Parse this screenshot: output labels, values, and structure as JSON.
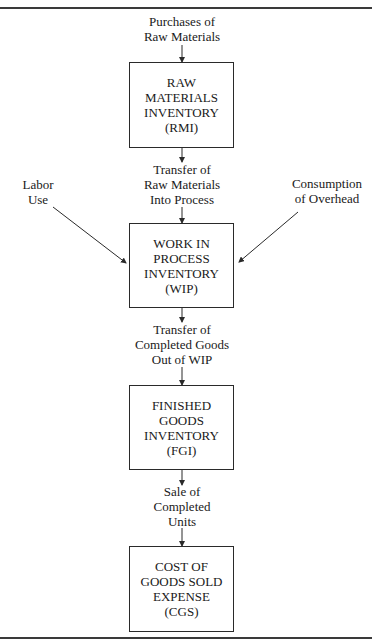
{
  "diagram": {
    "nodes": [
      {
        "id": "rmi",
        "lines": [
          "RAW",
          "MATERIALS",
          "INVENTORY",
          "(RMI)"
        ]
      },
      {
        "id": "wip",
        "lines": [
          "WORK IN",
          "PROCESS",
          "INVENTORY",
          "(WIP)"
        ]
      },
      {
        "id": "fgi",
        "lines": [
          "FINISHED",
          "GOODS",
          "INVENTORY",
          "(FGI)"
        ]
      },
      {
        "id": "cgs",
        "lines": [
          "COST OF",
          "GOODS SOLD",
          "EXPENSE",
          "(CGS)"
        ]
      }
    ],
    "flows": [
      {
        "id": "purchases",
        "lines": [
          "Purchases of",
          "Raw Materials"
        ],
        "to": "rmi"
      },
      {
        "id": "transfer-rm",
        "lines": [
          "Transfer of",
          "Raw Materials",
          "Into Process"
        ],
        "from": "rmi",
        "to": "wip"
      },
      {
        "id": "labor",
        "lines": [
          "Labor",
          "Use"
        ],
        "to": "wip"
      },
      {
        "id": "overhead",
        "lines": [
          "Consumption",
          "of Overhead"
        ],
        "to": "wip"
      },
      {
        "id": "transfer-cg",
        "lines": [
          "Transfer of",
          "Completed Goods",
          "Out of WIP"
        ],
        "from": "wip",
        "to": "fgi"
      },
      {
        "id": "sale",
        "lines": [
          "Sale of",
          "Completed",
          "Units"
        ],
        "from": "fgi",
        "to": "cgs"
      }
    ],
    "colors": {
      "line": "#2a2a2a",
      "background": "#ffffff",
      "text": "#1a1a1a"
    }
  }
}
